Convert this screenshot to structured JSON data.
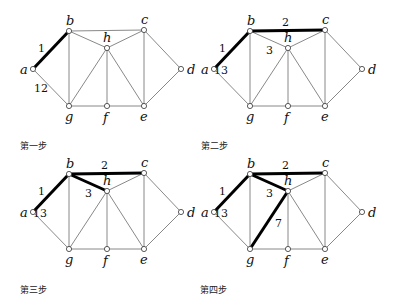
{
  "nodes": {
    "a": {
      "x": 33,
      "y": 69
    },
    "b": {
      "x": 69,
      "y": 31
    },
    "c": {
      "x": 144,
      "y": 30
    },
    "d": {
      "x": 181,
      "y": 69
    },
    "e": {
      "x": 144,
      "y": 106
    },
    "f": {
      "x": 107,
      "y": 106
    },
    "g": {
      "x": 69,
      "y": 106
    },
    "h": {
      "x": 107,
      "y": 48
    }
  },
  "node_labels": {
    "a": {
      "text": "a",
      "dx": -13,
      "dy": 5
    },
    "b": {
      "text": "b",
      "dx": -3,
      "dy": -6
    },
    "c": {
      "text": "c",
      "dx": -3,
      "dy": -6
    },
    "d": {
      "text": "d",
      "dx": 6,
      "dy": 5
    },
    "e": {
      "text": "e",
      "dx": -4,
      "dy": 15
    },
    "f": {
      "text": "f",
      "dx": -4,
      "dy": 16
    },
    "g": {
      "text": "g",
      "dx": -4,
      "dy": 15
    },
    "h": {
      "text": "h",
      "dx": -4,
      "dy": -6
    }
  },
  "edges": [
    [
      "a",
      "b"
    ],
    [
      "a",
      "g"
    ],
    [
      "b",
      "c"
    ],
    [
      "b",
      "h"
    ],
    [
      "b",
      "g"
    ],
    [
      "c",
      "h"
    ],
    [
      "c",
      "e"
    ],
    [
      "c",
      "d"
    ],
    [
      "d",
      "e"
    ],
    [
      "h",
      "g"
    ],
    [
      "h",
      "f"
    ],
    [
      "h",
      "e"
    ],
    [
      "g",
      "f"
    ],
    [
      "f",
      "e"
    ]
  ],
  "colors": {
    "thin_edge": "#7a7a7a",
    "bold_edge": "#000000",
    "node_fill": "#ffffff",
    "node_stroke": "#333333"
  },
  "steps": [
    {
      "label": "第一步",
      "offset": {
        "x": 0,
        "y": 0
      },
      "label_pos": {
        "x": 20,
        "y": 139
      },
      "bold_edges": [
        [
          "a",
          "b"
        ]
      ],
      "weights": [
        {
          "text": "1",
          "x": 38,
          "y": 52
        },
        {
          "text": "12",
          "x": 34,
          "y": 92
        }
      ]
    },
    {
      "label": "第二步",
      "offset": {
        "x": 181,
        "y": 0
      },
      "label_pos": {
        "x": 201,
        "y": 139
      },
      "bold_edges": [
        [
          "a",
          "b"
        ],
        [
          "b",
          "c"
        ]
      ],
      "weights": [
        {
          "text": "1",
          "x": 38,
          "y": 52
        },
        {
          "text": "2",
          "x": 101,
          "y": 26
        },
        {
          "text": "3",
          "x": 85,
          "y": 54
        },
        {
          "text": "13",
          "x": 33,
          "y": 74
        }
      ]
    },
    {
      "label": "第三步",
      "offset": {
        "x": 0,
        "y": 143
      },
      "label_pos": {
        "x": 20,
        "y": 283
      },
      "bold_edges": [
        [
          "a",
          "b"
        ],
        [
          "b",
          "c"
        ],
        [
          "b",
          "h"
        ]
      ],
      "weights": [
        {
          "text": "1",
          "x": 38,
          "y": 52
        },
        {
          "text": "2",
          "x": 101,
          "y": 26
        },
        {
          "text": "3",
          "x": 85,
          "y": 54
        },
        {
          "text": "13",
          "x": 33,
          "y": 74
        }
      ]
    },
    {
      "label": "第四步",
      "offset": {
        "x": 181,
        "y": 143
      },
      "label_pos": {
        "x": 200,
        "y": 283
      },
      "bold_edges": [
        [
          "a",
          "b"
        ],
        [
          "b",
          "c"
        ],
        [
          "b",
          "h"
        ],
        [
          "h",
          "g"
        ]
      ],
      "weights": [
        {
          "text": "1",
          "x": 38,
          "y": 52
        },
        {
          "text": "2",
          "x": 101,
          "y": 26
        },
        {
          "text": "3",
          "x": 85,
          "y": 54
        },
        {
          "text": "13",
          "x": 33,
          "y": 74
        },
        {
          "text": "7",
          "x": 94,
          "y": 84
        }
      ]
    }
  ]
}
